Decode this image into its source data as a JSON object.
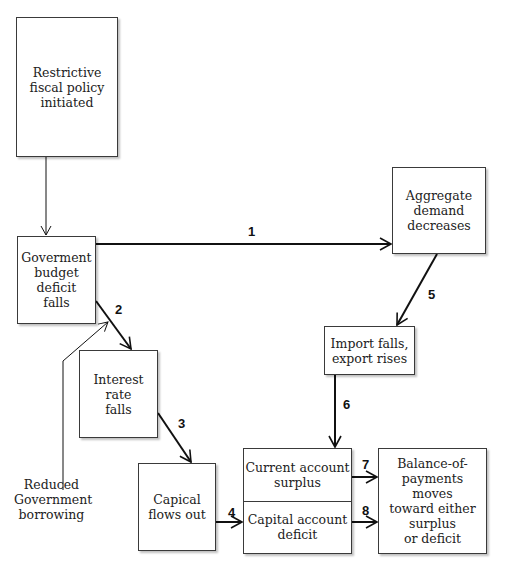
{
  "diagram": {
    "nodes": {
      "restrictive_policy": "Restrictive\nfiscal policy\ninitiated",
      "budget_deficit_falls": "Goverment\nbudget deficit\nfalls",
      "aggregate_demand": "Aggregate\ndemand\ndecreases",
      "import_export": "Import falls,\nexport rises",
      "interest_rate": "Interest\nrate\nfalls",
      "capital_flows": "Capical\nflows out",
      "current_account": "Current account\nsurplus",
      "capital_account": "Capital account\ndeficit",
      "balance_of_payments": "Balance-of-\npayments\nmoves\ntoward either\nsurplus\nor deficit"
    },
    "annotation": "Reduced\nGovernment\nborrowing",
    "edge_labels": {
      "e1": "1",
      "e2": "2",
      "e3": "3",
      "e4": "4",
      "e5": "5",
      "e6": "6",
      "e7": "7",
      "e8": "8"
    },
    "colors": {
      "line": "#111111",
      "box_border": "#3a3a3a",
      "background": "#ffffff"
    }
  }
}
